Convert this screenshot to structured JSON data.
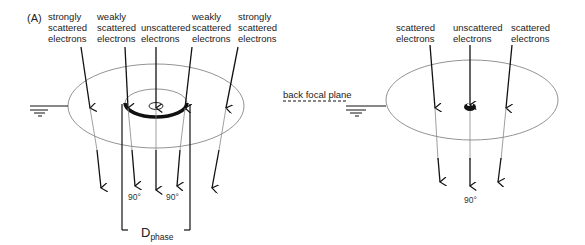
{
  "panel_label": "(A)",
  "left": {
    "labels": [
      {
        "lines": [
          "strongly",
          "scattered",
          "electrons"
        ]
      },
      {
        "lines": [
          "weakly",
          "scattered",
          "electrons"
        ]
      },
      {
        "lines": [
          "unscattered",
          "electrons"
        ]
      },
      {
        "lines": [
          "weakly",
          "scattered",
          "electrons"
        ]
      },
      {
        "lines": [
          "strongly",
          "scattered",
          "electrons"
        ]
      }
    ],
    "phase_labels": [
      "90°",
      "90°"
    ],
    "dimension_label": "D",
    "dimension_sub": "phase"
  },
  "right": {
    "plane_label": "back focal plane",
    "labels": [
      {
        "lines": [
          "scattered",
          "electrons"
        ]
      },
      {
        "lines": [
          "unscattered",
          "electrons"
        ]
      },
      {
        "lines": [
          "scattered",
          "electrons"
        ]
      }
    ],
    "phase_label": "90°"
  },
  "colors": {
    "line": "#111111",
    "thin": "#777777",
    "text": "#222222"
  }
}
